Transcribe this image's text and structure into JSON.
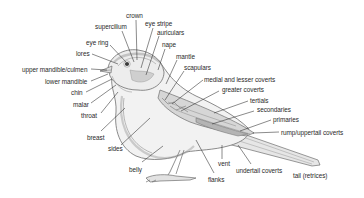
{
  "diagram": {
    "title": "",
    "labels": [
      {
        "id": "crown",
        "text": "crown",
        "x": 126,
        "y": 13,
        "lx1": 136,
        "ly1": 20,
        "lx2": 137,
        "ly2": 60
      },
      {
        "id": "supercilium",
        "text": "supercilium",
        "x": 95,
        "y": 24,
        "lx1": 122,
        "ly1": 31,
        "lx2": 134,
        "ly2": 62
      },
      {
        "id": "eye-stripe",
        "text": "eye stripe",
        "x": 145,
        "y": 21,
        "lx1": 153,
        "ly1": 28,
        "lx2": 141,
        "ly2": 68
      },
      {
        "id": "auriculars",
        "text": "auriculars",
        "x": 157,
        "y": 30,
        "lx1": 159,
        "ly1": 36,
        "lx2": 146,
        "ly2": 75
      },
      {
        "id": "eye-ring",
        "text": "eye ring",
        "x": 86,
        "y": 40,
        "lx1": 110,
        "ly1": 45,
        "lx2": 126,
        "ly2": 62
      },
      {
        "id": "nape",
        "text": "nape",
        "x": 162,
        "y": 42,
        "lx1": 165,
        "ly1": 49,
        "lx2": 158,
        "ly2": 70
      },
      {
        "id": "lores",
        "text": "lores",
        "x": 76,
        "y": 51,
        "lx1": 92,
        "ly1": 54,
        "lx2": 118,
        "ly2": 64
      },
      {
        "id": "mantle",
        "text": "mantle",
        "x": 176,
        "y": 54,
        "lx1": 177,
        "ly1": 60,
        "lx2": 166,
        "ly2": 84
      },
      {
        "id": "upper-mandible-culmen",
        "text": "upper mandible/culmen",
        "x": 22,
        "y": 67,
        "lx1": 91,
        "ly1": 69,
        "lx2": 107,
        "ly2": 70
      },
      {
        "id": "scapulars",
        "text": "scapulars",
        "x": 184,
        "y": 65,
        "lx1": 184,
        "ly1": 71,
        "lx2": 165,
        "ly2": 100
      },
      {
        "id": "medial-and-lesser-coverts",
        "text": "medial and lesser coverts",
        "x": 204,
        "y": 77,
        "lx1": 203,
        "ly1": 80,
        "lx2": 172,
        "ly2": 104
      },
      {
        "id": "lower-mandible",
        "text": "lower mandible",
        "x": 45,
        "y": 79,
        "lx1": 91,
        "ly1": 81,
        "lx2": 108,
        "ly2": 74
      },
      {
        "id": "greater-coverts",
        "text": "greater coverts",
        "x": 222,
        "y": 87,
        "lx1": 219,
        "ly1": 91,
        "lx2": 181,
        "ly2": 111
      },
      {
        "id": "chin",
        "text": "chin",
        "x": 71,
        "y": 90,
        "lx1": 86,
        "ly1": 92,
        "lx2": 112,
        "ly2": 79
      },
      {
        "id": "tertials",
        "text": "tertials",
        "x": 250,
        "y": 98,
        "lx1": 248,
        "ly1": 101,
        "lx2": 214,
        "ly2": 113
      },
      {
        "id": "malar",
        "text": "malar",
        "x": 73,
        "y": 102,
        "lx1": 91,
        "ly1": 103,
        "lx2": 116,
        "ly2": 85
      },
      {
        "id": "secondaries",
        "text": "secondaries",
        "x": 257,
        "y": 107,
        "lx1": 254,
        "ly1": 111,
        "lx2": 212,
        "ly2": 124
      },
      {
        "id": "throat",
        "text": "throat",
        "x": 81,
        "y": 113,
        "lx1": 101,
        "ly1": 113,
        "lx2": 118,
        "ly2": 92
      },
      {
        "id": "primaries",
        "text": "primaries",
        "x": 273,
        "y": 117,
        "lx1": 271,
        "ly1": 120,
        "lx2": 240,
        "ly2": 131
      },
      {
        "id": "rump-uppertail-coverts",
        "text": "rump/uppertail coverts",
        "x": 281,
        "y": 130,
        "lx1": 279,
        "ly1": 132,
        "lx2": 253,
        "ly2": 133
      },
      {
        "id": "breast",
        "text": "breast",
        "x": 87,
        "y": 135,
        "lx1": 101,
        "ly1": 131,
        "lx2": 125,
        "ly2": 108
      },
      {
        "id": "sides",
        "text": "sides",
        "x": 108,
        "y": 146,
        "lx1": 121,
        "ly1": 145,
        "lx2": 150,
        "ly2": 118
      },
      {
        "id": "vent",
        "text": "vent",
        "x": 218,
        "y": 161,
        "lx1": 222,
        "ly1": 159,
        "lx2": 222,
        "ly2": 145
      },
      {
        "id": "belly",
        "text": "belly",
        "x": 129,
        "y": 167,
        "lx1": 142,
        "ly1": 162,
        "lx2": 163,
        "ly2": 146
      },
      {
        "id": "undertail-coverts",
        "text": "undertail coverts",
        "x": 236,
        "y": 168,
        "lx1": 251,
        "ly1": 164,
        "lx2": 238,
        "ly2": 145
      },
      {
        "id": "tail-retrices",
        "text": "tail (retrices)",
        "x": 293,
        "y": 173,
        "lx1": 0,
        "ly1": 0,
        "lx2": 0,
        "ly2": 0
      },
      {
        "id": "flanks",
        "text": "flanks",
        "x": 208,
        "y": 177,
        "lx1": 214,
        "ly1": 173,
        "lx2": 196,
        "ly2": 140
      }
    ]
  },
  "colors": {
    "text": "#2a2a2a",
    "line": "#2a2a2a",
    "outline": "#6e6e6e",
    "fill_light": "#eeeeee",
    "fill_mid": "#d8d8d8",
    "fill_dark": "#b8b8b8",
    "background": "#ffffff"
  }
}
